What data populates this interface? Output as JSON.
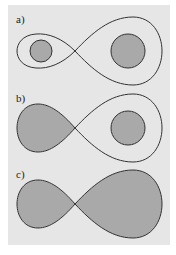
{
  "figure": {
    "background": "#e6e6e6",
    "stroke_color": "#333333",
    "fill_color": "#a9a9a9",
    "panels": [
      {
        "label": "a)",
        "description": "Figure-eight curve; both lobes unfilled, small filled disk inside left lobe, larger filled disk inside right lobe"
      },
      {
        "label": "b)",
        "description": "Figure-eight curve; left lobe filled, filled disk inside unfilled right lobe"
      },
      {
        "label": "c)",
        "description": "Figure-eight curve; both lobes filled"
      }
    ]
  }
}
